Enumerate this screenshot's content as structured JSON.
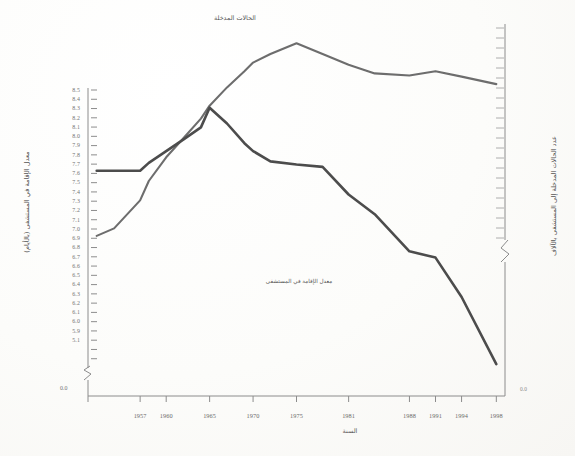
{
  "figure": {
    "background_color": "#fdfdfc",
    "ink_color": "#555555"
  },
  "axis_titles": {
    "left": "معدل الإقامة في المستشفى (بالأيام)",
    "right": "عدد الحالات المدخلة إلى المستشفى بالآلاف",
    "x": "السنة"
  },
  "series_labels": {
    "admitted": "الحالات المدخلة",
    "stay": "معدل الإقامة في المستشفى"
  },
  "left_axis": {
    "ticks": [
      "8.5",
      "8.4",
      "8.3",
      "8.2",
      "8.1",
      "8.0",
      "7.9",
      "7.8",
      "7.7",
      "7.6",
      "7.5",
      "7.4",
      "7.3",
      "7.2",
      "7.1",
      "7.0",
      "6.9",
      "6.8",
      "6.7",
      "6.6",
      "6.5",
      "6.4",
      "6.3",
      "6.2",
      "6.1",
      "6.0",
      "5.9",
      "5.1"
    ],
    "break_marker": "⌁",
    "zero_label": "0.0"
  },
  "right_axis": {
    "tick_count": 22,
    "break_marker": "⌁",
    "zero_label": "0.0"
  },
  "x_axis": {
    "ticks": [
      "1957",
      "1960",
      "1965",
      "1970",
      "1975",
      "1981",
      "1988",
      "1991",
      "1994",
      "1998"
    ]
  },
  "chart_data": {
    "type": "line",
    "title": "",
    "subtitle": "",
    "xlabel": "السنة",
    "ylabel": "معدل الإقامة في المستشفى (بالأيام)",
    "ylabel_right": "عدد الحالات المدخلة إلى المستشفى بالآلاف",
    "grid": false,
    "legend": "inline-annotations",
    "x": [
      1952,
      1954,
      1957,
      1958,
      1960,
      1962,
      1964,
      1965,
      1967,
      1969,
      1970,
      1972,
      1975,
      1978,
      1981,
      1984,
      1988,
      1991,
      1994,
      1998
    ],
    "xlim": [
      1951,
      1999
    ],
    "ylim_left": [
      5.0,
      8.55
    ],
    "ylim_right": [
      0,
      34
    ],
    "series": [
      {
        "name": "الحالات المدخلة",
        "axis": "right",
        "units": "thousands",
        "values": [
          14.5,
          15.2,
          17.8,
          19.6,
          21.8,
          23.6,
          25.4,
          26.6,
          28.3,
          29.8,
          30.6,
          31.4,
          32.4,
          31.4,
          30.4,
          29.6,
          29.4,
          29.8,
          29.3,
          28.6
        ]
      },
      {
        "name": "معدل الإقامة في المستشفى",
        "axis": "left",
        "units": "days",
        "values": [
          7.5,
          7.5,
          7.5,
          7.6,
          7.75,
          7.9,
          8.05,
          8.3,
          8.1,
          7.85,
          7.75,
          7.62,
          7.58,
          7.55,
          7.2,
          6.95,
          6.48,
          6.4,
          5.9,
          5.05
        ]
      }
    ],
    "annotations": [
      {
        "text": "الحالات المدخلة",
        "x_px": 233,
        "y_px": 18
      },
      {
        "text": "معدل الإقامة في المستشفى",
        "x_px": 250,
        "y_px": 280
      }
    ]
  }
}
